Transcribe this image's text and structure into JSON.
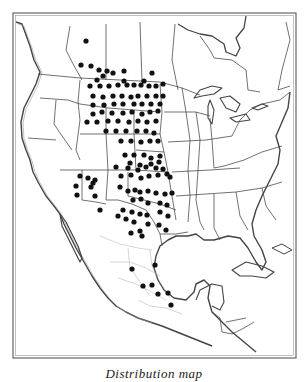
{
  "map": {
    "title": "",
    "region": "North America (Canada, United States, Mexico, Central America)",
    "border_color": "#555555",
    "line_color": "#333333",
    "dot_color": "#111111",
    "background": "#ffffff"
  },
  "caption": {
    "text": "Distribution map"
  },
  "locality_dots": [
    [
      86,
      41
    ],
    [
      81,
      65
    ],
    [
      91,
      66
    ],
    [
      99,
      70
    ],
    [
      107,
      71
    ],
    [
      124,
      71
    ],
    [
      124,
      81
    ],
    [
      97,
      80
    ],
    [
      103,
      76
    ],
    [
      113,
      73
    ],
    [
      90,
      86
    ],
    [
      100,
      86
    ],
    [
      109,
      86
    ],
    [
      118,
      85
    ],
    [
      127,
      85
    ],
    [
      134,
      85
    ],
    [
      141,
      85
    ],
    [
      149,
      86
    ],
    [
      156,
      86
    ],
    [
      163,
      84
    ],
    [
      152,
      73
    ],
    [
      144,
      81
    ],
    [
      93,
      96
    ],
    [
      103,
      97
    ],
    [
      113,
      96
    ],
    [
      122,
      96
    ],
    [
      131,
      97
    ],
    [
      138,
      96
    ],
    [
      147,
      96
    ],
    [
      156,
      96
    ],
    [
      163,
      96
    ],
    [
      93,
      105
    ],
    [
      104,
      105
    ],
    [
      114,
      104
    ],
    [
      123,
      104
    ],
    [
      134,
      104
    ],
    [
      142,
      104
    ],
    [
      151,
      104
    ],
    [
      160,
      104
    ],
    [
      93,
      114
    ],
    [
      102,
      112
    ],
    [
      112,
      113
    ],
    [
      123,
      113
    ],
    [
      132,
      112
    ],
    [
      142,
      114
    ],
    [
      150,
      112
    ],
    [
      158,
      111
    ],
    [
      87,
      122
    ],
    [
      97,
      122
    ],
    [
      108,
      121
    ],
    [
      118,
      121
    ],
    [
      129,
      122
    ],
    [
      138,
      121
    ],
    [
      147,
      122
    ],
    [
      156,
      121
    ],
    [
      106,
      131
    ],
    [
      116,
      131
    ],
    [
      126,
      131
    ],
    [
      137,
      131
    ],
    [
      146,
      131
    ],
    [
      154,
      133
    ],
    [
      121,
      141
    ],
    [
      131,
      141
    ],
    [
      141,
      142
    ],
    [
      150,
      141
    ],
    [
      158,
      141
    ],
    [
      125,
      155
    ],
    [
      134,
      155
    ],
    [
      144,
      155
    ],
    [
      151,
      158
    ],
    [
      160,
      156
    ],
    [
      130,
      163
    ],
    [
      140,
      165
    ],
    [
      151,
      164
    ],
    [
      159,
      162
    ],
    [
      116,
      167
    ],
    [
      128,
      168
    ],
    [
      138,
      170
    ],
    [
      146,
      167
    ],
    [
      156,
      168
    ],
    [
      163,
      169
    ],
    [
      121,
      176
    ],
    [
      131,
      175
    ],
    [
      141,
      178
    ],
    [
      149,
      176
    ],
    [
      158,
      175
    ],
    [
      167,
      174
    ],
    [
      170,
      177
    ],
    [
      80,
      176
    ],
    [
      88,
      178
    ],
    [
      93,
      183
    ],
    [
      95,
      180
    ],
    [
      76,
      186
    ],
    [
      91,
      187
    ],
    [
      77,
      195
    ],
    [
      95,
      196
    ],
    [
      120,
      187
    ],
    [
      128,
      191
    ],
    [
      135,
      190
    ],
    [
      140,
      192
    ],
    [
      148,
      191
    ],
    [
      156,
      193
    ],
    [
      165,
      194
    ],
    [
      172,
      193
    ],
    [
      133,
      200
    ],
    [
      141,
      199
    ],
    [
      148,
      203
    ],
    [
      160,
      203
    ],
    [
      167,
      205
    ],
    [
      100,
      210
    ],
    [
      123,
      210
    ],
    [
      132,
      212
    ],
    [
      140,
      214
    ],
    [
      147,
      215
    ],
    [
      160,
      212
    ],
    [
      168,
      216
    ],
    [
      118,
      216
    ],
    [
      126,
      219
    ],
    [
      148,
      224
    ],
    [
      159,
      225
    ],
    [
      134,
      222
    ],
    [
      140,
      231
    ],
    [
      166,
      230
    ],
    [
      131,
      233
    ],
    [
      142,
      236
    ],
    [
      132,
      269
    ],
    [
      155,
      265
    ],
    [
      143,
      286
    ],
    [
      152,
      285
    ],
    [
      158,
      294
    ],
    [
      168,
      293
    ],
    [
      171,
      305
    ]
  ]
}
